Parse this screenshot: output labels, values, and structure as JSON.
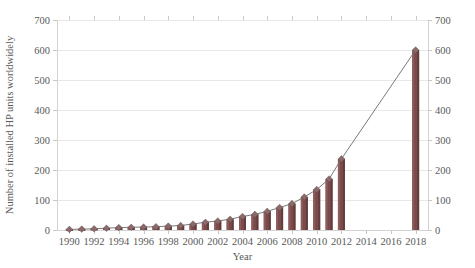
{
  "chart_data": {
    "type": "bar",
    "title": "",
    "subtitle": "",
    "xlabel": "Year",
    "ylabel": "Number of installed HP units worldwidely",
    "ylabel_right": "",
    "ylim": [
      0,
      700
    ],
    "yticks": [
      0,
      100,
      200,
      300,
      400,
      500,
      600,
      700
    ],
    "ytick_labels": [
      "0",
      "100",
      "200",
      "300",
      "400",
      "500",
      "600",
      "700"
    ],
    "right_axis": true,
    "right_yticks": [
      0,
      100,
      200,
      300,
      400,
      500,
      600,
      700
    ],
    "right_ytick_labels": [
      "0",
      "100",
      "200",
      "300",
      "400",
      "500",
      "600",
      "700"
    ],
    "xlim": [
      1989,
      2019
    ],
    "xticks": [
      1990,
      1992,
      1994,
      1996,
      1998,
      2000,
      2002,
      2004,
      2006,
      2008,
      2010,
      2012,
      2014,
      2016,
      2018
    ],
    "xtick_labels": [
      "1990",
      "1992",
      "1994",
      "1996",
      "1998",
      "2000",
      "2002",
      "2004",
      "2006",
      "2008",
      "2010",
      "2012",
      "2014",
      "2016",
      "2018"
    ],
    "grid": true,
    "legend": false,
    "categories": [
      1990,
      1991,
      1992,
      1993,
      1994,
      1995,
      1996,
      1997,
      1998,
      1999,
      2000,
      2001,
      2002,
      2003,
      2004,
      2005,
      2006,
      2007,
      2008,
      2009,
      2010,
      2011,
      2012,
      2018
    ],
    "values": [
      2,
      3,
      4,
      6,
      8,
      9,
      10,
      11,
      13,
      15,
      20,
      26,
      30,
      36,
      45,
      52,
      62,
      75,
      88,
      110,
      135,
      170,
      237,
      600
    ],
    "series": [
      {
        "name": "Installed HP units",
        "type": "bar",
        "values": [
          2,
          3,
          4,
          6,
          8,
          9,
          10,
          11,
          13,
          15,
          20,
          26,
          30,
          36,
          45,
          52,
          62,
          75,
          88,
          110,
          135,
          170,
          237,
          600
        ]
      },
      {
        "name": "Trend",
        "type": "line",
        "values": [
          2,
          3,
          4,
          6,
          8,
          9,
          10,
          11,
          13,
          15,
          20,
          26,
          30,
          36,
          45,
          52,
          62,
          75,
          88,
          110,
          135,
          170,
          237,
          600
        ]
      }
    ],
    "annotations": []
  }
}
